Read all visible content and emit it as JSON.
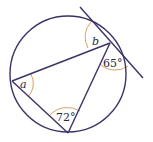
{
  "diagram": {
    "type": "circle-theorem",
    "colors": {
      "line": "#3b3266",
      "arc": "#d9a066",
      "text": "#2a2a3a",
      "background": "#ffffff"
    },
    "circle": {
      "cx": 68,
      "cy": 74,
      "r": 58
    },
    "points": {
      "left": {
        "x": 12,
        "y": 81
      },
      "top_right": {
        "x": 110,
        "y": 43
      },
      "bottom": {
        "x": 68,
        "y": 133
      }
    },
    "tangent": {
      "x1": 80,
      "y1": 7,
      "x2": 143,
      "y2": 78
    },
    "labels": {
      "a": "a",
      "b": "b",
      "angle_65": "65°",
      "angle_72": "72°"
    }
  }
}
